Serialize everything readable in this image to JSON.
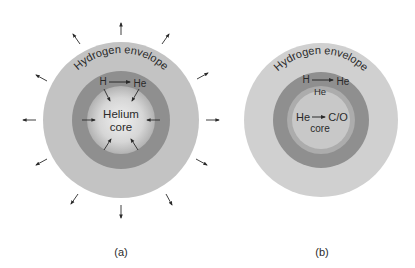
{
  "panels": [
    {
      "caption": "(a)",
      "envelope_label": "Hydrogen envelope",
      "shell_reaction": {
        "from": "H",
        "to": "He"
      },
      "core_label_line1": "Helium",
      "core_label_line2": "core",
      "colors": {
        "envelope": "#c3c3c3",
        "shell": "#8f8f8f",
        "core_center": "#eeeeee",
        "core_edge": "#b4b4b4"
      }
    },
    {
      "caption": "(b)",
      "envelope_label": "Hydrogen envelope",
      "shell_reaction": {
        "from": "H",
        "to": "He"
      },
      "he_layer_label": "He",
      "core_reaction": {
        "from": "He",
        "to": "C/O"
      },
      "core_label": "core",
      "colors": {
        "envelope": "#d0d0d0",
        "shell": "#8f8f8f",
        "he_layer": "#acacac",
        "core": "#c8c8c8"
      }
    }
  ]
}
